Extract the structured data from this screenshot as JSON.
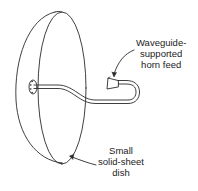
{
  "diagram": {
    "type": "technical-illustration",
    "colors": {
      "line": "#2a2a2a",
      "background": "#ffffff",
      "text": "#222222"
    },
    "labels": {
      "feed": {
        "lines": [
          "Waveguide-",
          "supported",
          "horn feed"
        ]
      },
      "dish": {
        "lines": [
          "Small",
          "solid-sheet",
          "dish"
        ]
      }
    },
    "components": [
      {
        "id": "dish",
        "name": "Small solid-sheet dish"
      },
      {
        "id": "mount-plate",
        "name": "Waveguide mounting flange"
      },
      {
        "id": "waveguide",
        "name": "Curved waveguide support"
      },
      {
        "id": "horn",
        "name": "Horn feed"
      }
    ]
  }
}
